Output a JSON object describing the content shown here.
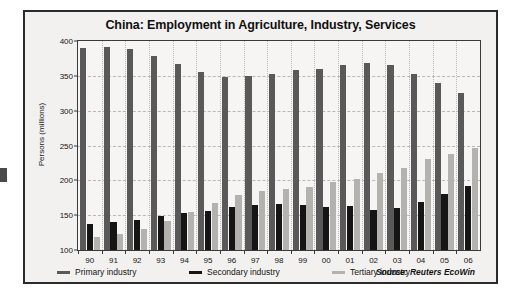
{
  "chart_data": {
    "type": "bar",
    "title": "China: Employment in Agriculture, Industry, Services",
    "xlabel": "",
    "ylabel": "Persons (millions)",
    "ylim": [
      100,
      400
    ],
    "yticks": [
      100,
      150,
      200,
      250,
      300,
      350,
      400
    ],
    "grid": true,
    "legend_position": "bottom",
    "categories": [
      "90",
      "91",
      "92",
      "93",
      "94",
      "95",
      "96",
      "97",
      "98",
      "99",
      "00",
      "01",
      "02",
      "03",
      "04",
      "05",
      "06"
    ],
    "series": [
      {
        "name": "Primary industry",
        "color": "#595959",
        "values": [
          390,
          391,
          389,
          378,
          367,
          355,
          348,
          350,
          352,
          358,
          360,
          366,
          369,
          366,
          353,
          340,
          326
        ]
      },
      {
        "name": "Secondary industry",
        "color": "#151515",
        "values": [
          138,
          140,
          143,
          149,
          153,
          156,
          162,
          165,
          166,
          164,
          162,
          163,
          158,
          161,
          169,
          181,
          192
        ]
      },
      {
        "name": "Tertiary industry",
        "color": "#b4b2af",
        "values": [
          119,
          123,
          130,
          142,
          154,
          168,
          179,
          184,
          188,
          191,
          198,
          202,
          210,
          218,
          230,
          238,
          246
        ]
      }
    ],
    "annotations": [
      "Source: Reuters EcoWin"
    ]
  },
  "chart": {
    "title": "China: Employment in Agriculture, Industry, Services",
    "y_axis_title": "Persons (millions)",
    "source": "Source: Reuters EcoWin"
  },
  "legend": {
    "items": [
      {
        "label": "Primary industry"
      },
      {
        "label": "Secondary industry"
      },
      {
        "label": "Tertiary industry"
      }
    ]
  }
}
